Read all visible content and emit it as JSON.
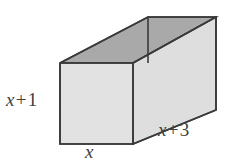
{
  "figure": {
    "type": "rectangular-prism-diagram",
    "shape_name": "rectangular prism",
    "colors": {
      "top_face": "#a9a9a9",
      "front_face": "#e2e2e2",
      "right_face": "#dedede",
      "edge_stroke": "#3a3a3a",
      "label_text": "#404040",
      "background": "#ffffff"
    },
    "labels": {
      "height": {
        "var": "x",
        "op": "+",
        "num": "1",
        "full": "x + 1",
        "edge": "front-left-vertical"
      },
      "width": {
        "var": "x",
        "op": "",
        "num": "",
        "full": "x",
        "edge": "front-bottom-horizontal"
      },
      "depth": {
        "var": "x",
        "op": "+",
        "num": "3",
        "full": "x + 3",
        "edge": "right-bottom-receding"
      }
    },
    "geometry": {
      "front_face": "60,63 133,63 133,144 60,144",
      "right_face": "133,63 216,17 216,110 133,144",
      "top_face": "60,63 148,17 216,17 133,63",
      "back_inner_edge": "148,17 148,63",
      "hidden_edges": "none"
    }
  }
}
